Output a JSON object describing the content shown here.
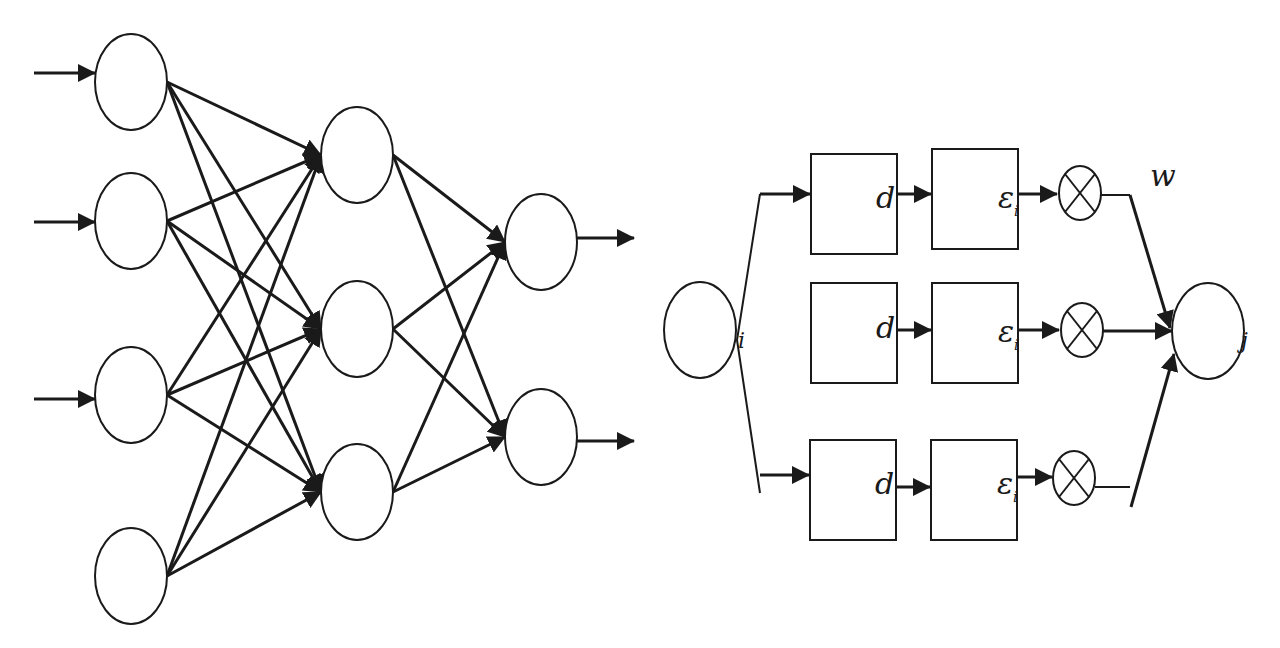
{
  "diagram": {
    "title": "",
    "colors": {
      "stroke": "#1a1a1a",
      "background": "#ffffff"
    },
    "neural_network": {
      "layers": [
        {
          "name": "input",
          "count": 4,
          "inputs_with_arrows": [
            true,
            true,
            true,
            false
          ]
        },
        {
          "name": "hidden",
          "count": 3
        },
        {
          "name": "output",
          "count": 2
        }
      ],
      "connectivity": "fully-connected"
    },
    "weight_path": {
      "source_label": "i",
      "target_label": "j",
      "weight_label": "w",
      "branches": [
        {
          "delay_label": "d",
          "epsilon_label": "ε",
          "epsilon_subscript": "i",
          "operator": "⊗"
        },
        {
          "delay_label": "d",
          "epsilon_label": "ε",
          "epsilon_subscript": "i",
          "operator": "⊗"
        },
        {
          "delay_label": "d",
          "epsilon_label": "ε",
          "epsilon_subscript": "i",
          "epsilon_superscript": "1",
          "operator": "⊗"
        }
      ]
    }
  }
}
